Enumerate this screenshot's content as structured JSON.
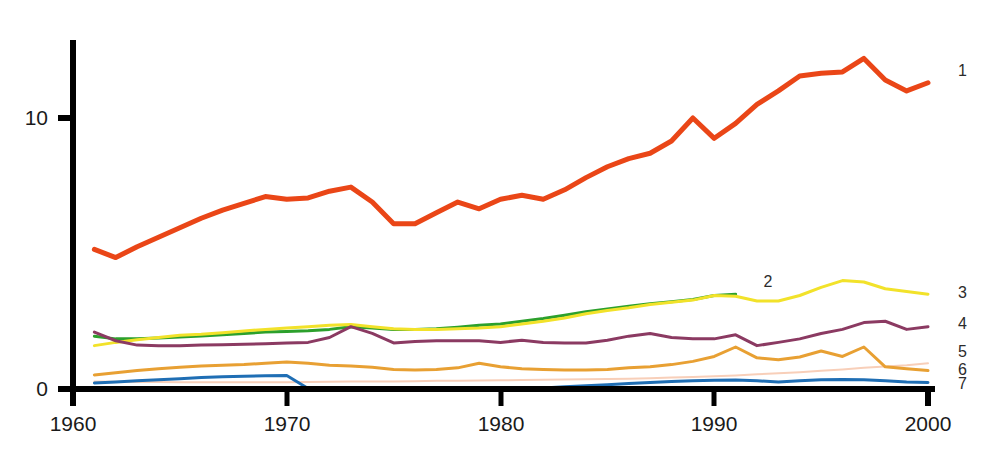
{
  "chart_data": {
    "type": "line",
    "title": "",
    "subtitle": "",
    "xlabel": "",
    "ylabel": "",
    "xlim": [
      1960,
      2000
    ],
    "ylim": [
      0,
      12.7
    ],
    "grid": false,
    "legend_position": "right-end-of-line",
    "x_ticks": [
      "1960",
      "1970",
      "1980",
      "1990",
      "2000"
    ],
    "x_tick_values": [
      1960,
      1970,
      1980,
      1990,
      2000
    ],
    "y_ticks": [
      "0",
      "10"
    ],
    "y_tick_values": [
      0,
      10
    ],
    "x": [
      1961,
      1962,
      1963,
      1964,
      1965,
      1966,
      1967,
      1968,
      1969,
      1970,
      1971,
      1972,
      1973,
      1974,
      1975,
      1976,
      1977,
      1978,
      1979,
      1980,
      1981,
      1982,
      1983,
      1984,
      1985,
      1986,
      1987,
      1988,
      1989,
      1990,
      1991,
      1992,
      1993,
      1994,
      1995,
      1996,
      1997,
      1998,
      1999,
      2000
    ],
    "series": [
      {
        "name": "1",
        "label": "1",
        "color": "#ea4617",
        "width": 5,
        "values": [
          5.15,
          4.85,
          5.25,
          5.6,
          5.95,
          6.3,
          6.6,
          6.85,
          7.1,
          7.0,
          7.05,
          7.3,
          7.45,
          6.9,
          6.1,
          6.1,
          6.5,
          6.9,
          6.65,
          7.0,
          7.15,
          7.0,
          7.35,
          7.8,
          8.2,
          8.5,
          8.7,
          9.15,
          10.0,
          9.25,
          9.8,
          10.5,
          11.0,
          11.55,
          11.65,
          11.7,
          12.2,
          11.4,
          11.0,
          11.3
        ]
      },
      {
        "name": "2",
        "label": "2",
        "color": "#2ca02c",
        "width": 3,
        "values": [
          1.95,
          1.85,
          1.85,
          1.88,
          1.92,
          1.96,
          2.0,
          2.05,
          2.1,
          2.12,
          2.15,
          2.2,
          2.3,
          2.25,
          2.2,
          2.2,
          2.22,
          2.28,
          2.35,
          2.4,
          2.5,
          2.6,
          2.72,
          2.85,
          2.95,
          3.05,
          3.15,
          3.22,
          3.3,
          3.45,
          3.5,
          null,
          null,
          null,
          null,
          null,
          null,
          null,
          null,
          null
        ]
      },
      {
        "name": "3",
        "label": "3",
        "color": "#f2e22a",
        "width": 3,
        "values": [
          1.6,
          1.72,
          1.82,
          1.9,
          1.98,
          2.02,
          2.08,
          2.14,
          2.2,
          2.25,
          2.3,
          2.35,
          2.38,
          2.3,
          2.22,
          2.2,
          2.2,
          2.22,
          2.25,
          2.3,
          2.4,
          2.5,
          2.62,
          2.78,
          2.9,
          3.0,
          3.12,
          3.2,
          3.28,
          3.45,
          3.42,
          3.25,
          3.25,
          3.45,
          3.75,
          4.0,
          3.95,
          3.7,
          3.6,
          3.5
        ]
      },
      {
        "name": "4",
        "label": "4",
        "color": "#8b3a62",
        "width": 3,
        "values": [
          2.1,
          1.78,
          1.62,
          1.6,
          1.6,
          1.62,
          1.63,
          1.65,
          1.67,
          1.7,
          1.72,
          1.9,
          2.3,
          2.05,
          1.7,
          1.75,
          1.78,
          1.78,
          1.78,
          1.72,
          1.8,
          1.72,
          1.7,
          1.7,
          1.8,
          1.95,
          2.05,
          1.9,
          1.85,
          1.85,
          2.0,
          1.6,
          1.72,
          1.85,
          2.05,
          2.2,
          2.45,
          2.5,
          2.2,
          2.3
        ]
      },
      {
        "name": "5",
        "label": "5",
        "color": "#f8cfb9",
        "width": 2,
        "values": [
          0.28,
          0.27,
          0.26,
          0.26,
          0.25,
          0.25,
          0.25,
          0.25,
          0.25,
          0.25,
          0.26,
          0.27,
          0.28,
          0.28,
          0.28,
          0.29,
          0.3,
          0.3,
          0.31,
          0.32,
          0.33,
          0.34,
          0.35,
          0.36,
          0.37,
          0.38,
          0.4,
          0.42,
          0.44,
          0.47,
          0.5,
          0.54,
          0.58,
          0.62,
          0.67,
          0.72,
          0.78,
          0.83,
          0.88,
          0.95
        ]
      },
      {
        "name": "6",
        "label": "6",
        "color": "#e8a033",
        "width": 3,
        "values": [
          0.52,
          0.6,
          0.68,
          0.75,
          0.8,
          0.85,
          0.88,
          0.9,
          0.95,
          1.0,
          0.95,
          0.88,
          0.85,
          0.8,
          0.72,
          0.7,
          0.72,
          0.78,
          0.95,
          0.82,
          0.75,
          0.72,
          0.7,
          0.7,
          0.72,
          0.78,
          0.82,
          0.9,
          1.02,
          1.2,
          1.55,
          1.15,
          1.08,
          1.18,
          1.4,
          1.2,
          1.55,
          0.82,
          0.75,
          0.68
        ]
      },
      {
        "name": "7",
        "label": "7",
        "color": "#1f6eb4",
        "width": 3,
        "values": [
          0.22,
          0.26,
          0.3,
          0.34,
          0.38,
          0.42,
          0.45,
          0.47,
          0.49,
          0.5,
          0.02,
          0.02,
          0.02,
          0.02,
          0.02,
          0.02,
          0.02,
          0.02,
          0.02,
          0.02,
          0.02,
          0.04,
          0.08,
          0.12,
          0.16,
          0.2,
          0.24,
          0.28,
          0.3,
          0.32,
          0.33,
          0.3,
          0.26,
          0.3,
          0.34,
          0.35,
          0.34,
          0.3,
          0.26,
          0.24
        ]
      }
    ],
    "series_label_positions": [
      {
        "label": "1",
        "x": 2001.4,
        "y": 11.75
      },
      {
        "label": "2",
        "x": 1992.3,
        "y": 3.95
      },
      {
        "label": "3",
        "x": 2001.4,
        "y": 3.55
      },
      {
        "label": "4",
        "x": 2001.4,
        "y": 2.4
      },
      {
        "label": "5",
        "x": 2001.4,
        "y": 1.35
      },
      {
        "label": "6",
        "x": 2001.4,
        "y": 0.72
      },
      {
        "label": "7",
        "x": 2001.4,
        "y": 0.2
      }
    ],
    "axis_color": "#000000",
    "background_color": "#ffffff"
  },
  "axes": {
    "x_labels": [
      {
        "text": "1960",
        "value": 1960
      },
      {
        "text": "1970",
        "value": 1970
      },
      {
        "text": "1980",
        "value": 1980
      },
      {
        "text": "1990",
        "value": 1990
      },
      {
        "text": "2000",
        "value": 2000
      }
    ],
    "y_labels": [
      {
        "text": "10",
        "value": 10
      },
      {
        "text": "0",
        "value": 0
      }
    ]
  },
  "labels": {
    "s1": "1",
    "s2": "2",
    "s3": "3",
    "s4": "4",
    "s5": "5",
    "s6": "6",
    "s7": "7",
    "x0": "1960",
    "x1": "1970",
    "x2": "1980",
    "x3": "1990",
    "x4": "2000",
    "y0": "0",
    "y10": "10"
  }
}
